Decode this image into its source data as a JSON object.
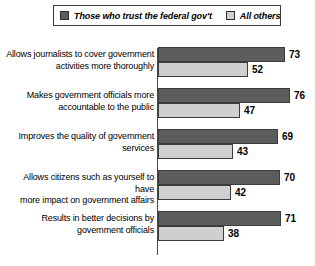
{
  "legend": {
    "entries": [
      {
        "label": "Those who trust the federal gov't",
        "swatch": "dark-gray-swatch-icon",
        "color": "#5d5d5d"
      },
      {
        "label": "All others",
        "swatch": "light-gray-swatch-icon",
        "color": "#cfcfcf"
      }
    ]
  },
  "chart_data": {
    "type": "bar",
    "title": "",
    "xlabel": "",
    "ylabel": "",
    "xlim": [
      0,
      80
    ],
    "grid": false,
    "orientation": "horizontal",
    "legend_position": "top",
    "categories": [
      "Allows journalists to cover government activities more thoroughly",
      "Makes government officials more accountable to the public",
      "Improves the quality of government services",
      "Allows citizens such as yourself to have more impact on government affairs",
      "Results in better decisions by government officials"
    ],
    "category_lines": [
      [
        "Allows journalists to cover government",
        "activities more thoroughly"
      ],
      [
        "Makes government officials more",
        "accountable to the public"
      ],
      [
        "Improves the quality of government",
        "services"
      ],
      [
        "Allows citizens such as yourself to have",
        "more impact on government affairs"
      ],
      [
        "Results in better decisions by",
        "government officials"
      ]
    ],
    "series": [
      {
        "name": "Those who trust the federal gov't",
        "color": "#5d5d5d",
        "values": [
          73,
          76,
          69,
          70,
          71
        ]
      },
      {
        "name": "All others",
        "color": "#cfcfcf",
        "values": [
          52,
          47,
          43,
          42,
          38
        ]
      }
    ]
  },
  "groups": [
    {
      "line1": "Allows journalists to cover government",
      "line2": "activities more thoroughly",
      "top_value": "73",
      "bottom_value": "52"
    },
    {
      "line1": "Makes government officials more",
      "line2": "accountable to the public",
      "top_value": "76",
      "bottom_value": "47"
    },
    {
      "line1": "Improves the quality of government",
      "line2": "services",
      "top_value": "69",
      "bottom_value": "43"
    },
    {
      "line1": "Allows citizens such as yourself to have",
      "line2": "more impact on government affairs",
      "top_value": "70",
      "bottom_value": "42"
    },
    {
      "line1": "Results in better decisions by",
      "line2": "government officials",
      "top_value": "71",
      "bottom_value": "38"
    }
  ]
}
